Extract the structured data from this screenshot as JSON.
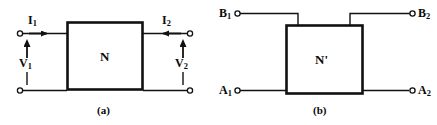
{
  "figure": {
    "background_color": "#ffffff",
    "line_color": "#111111",
    "panels": [
      {
        "id": "panel-a",
        "caption": "(a)",
        "box_label": "N",
        "description": "two-port network N with port currents and voltages",
        "annotations": [
          {
            "name": "current-1",
            "text": "I",
            "subscript": "1"
          },
          {
            "name": "current-2",
            "text": "I",
            "subscript": "2"
          },
          {
            "name": "voltage-1",
            "text": "V",
            "subscript": "1"
          },
          {
            "name": "voltage-2",
            "text": "V",
            "subscript": "2"
          }
        ]
      },
      {
        "id": "panel-b",
        "caption": "(b)",
        "box_label": "N'",
        "description": "network N-prime with terminals A1 A2 B1 B2",
        "annotations": [
          {
            "name": "terminal-b1",
            "text": "B",
            "subscript": "1"
          },
          {
            "name": "terminal-b2",
            "text": "B",
            "subscript": "2"
          },
          {
            "name": "terminal-a1",
            "text": "A",
            "subscript": "1"
          },
          {
            "name": "terminal-a2",
            "text": "A",
            "subscript": "2"
          }
        ]
      }
    ]
  },
  "labels": {
    "i1": "I",
    "i1_sub": "1",
    "i2": "I",
    "i2_sub": "2",
    "v1": "V",
    "v1_sub": "1",
    "v2": "V",
    "v2_sub": "2",
    "n": "N",
    "nprime": "N'",
    "b1": "B",
    "b1_sub": "1",
    "b2": "B",
    "b2_sub": "2",
    "a1": "A",
    "a1_sub": "1",
    "a2": "A",
    "a2_sub": "2",
    "caption_a": "(a)",
    "caption_b": "(b)"
  }
}
